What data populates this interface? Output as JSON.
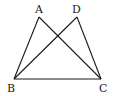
{
  "diagram": {
    "points": [
      {
        "name": "A",
        "x": 39,
        "y": 17,
        "label_x": 35,
        "label_y": 13
      },
      {
        "name": "D",
        "x": 77,
        "y": 17,
        "label_x": 72,
        "label_y": 13
      },
      {
        "name": "B",
        "x": 14,
        "y": 79,
        "label_x": 7,
        "label_y": 92
      },
      {
        "name": "C",
        "x": 101,
        "y": 79,
        "label_x": 99,
        "label_y": 92
      }
    ],
    "segments": [
      [
        "A",
        "B"
      ],
      [
        "A",
        "C"
      ],
      [
        "D",
        "B"
      ],
      [
        "D",
        "C"
      ],
      [
        "B",
        "C"
      ]
    ],
    "labels": {
      "A": "A",
      "D": "D",
      "B": "B",
      "C": "C"
    }
  }
}
